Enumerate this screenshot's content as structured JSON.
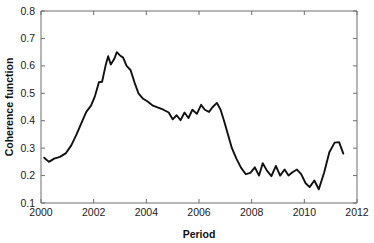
{
  "chart_data": {
    "type": "line",
    "title": "",
    "xlabel": "Period",
    "ylabel": "Coherence function",
    "xlim": [
      2000,
      2012
    ],
    "ylim": [
      0.1,
      0.8
    ],
    "xticks": [
      2000,
      2002,
      2004,
      2006,
      2008,
      2010,
      2012
    ],
    "xtick_labels": [
      "2000",
      "2002",
      "2004",
      "2006",
      "2008",
      "2010",
      "2012"
    ],
    "yticks": [
      0.1,
      0.2,
      0.3,
      0.4,
      0.5,
      0.6,
      0.7,
      0.8
    ],
    "ytick_labels": [
      "0.1",
      "0.2",
      "0.3",
      "0.4",
      "0.5",
      "0.6",
      "0.7",
      "0.8"
    ],
    "grid": false,
    "legend": null,
    "line_color": "#111111",
    "axis_color": "#6f6f6f",
    "background_color": "#ffffff",
    "series": [
      {
        "name": "Coherence function",
        "x": [
          2000.12,
          2000.3,
          2000.5,
          2000.72,
          2000.95,
          2001.15,
          2001.35,
          2001.55,
          2001.72,
          2001.9,
          2002.05,
          2002.2,
          2002.32,
          2002.45,
          2002.55,
          2002.65,
          2002.78,
          2002.88,
          2003.0,
          2003.12,
          2003.25,
          2003.4,
          2003.55,
          2003.7,
          2003.88,
          2004.05,
          2004.25,
          2004.45,
          2004.65,
          2004.85,
          2005.0,
          2005.15,
          2005.3,
          2005.45,
          2005.6,
          2005.75,
          2005.92,
          2006.08,
          2006.22,
          2006.38,
          2006.52,
          2006.68,
          2006.82,
          2006.95,
          2007.1,
          2007.25,
          2007.42,
          2007.6,
          2007.78,
          2007.95,
          2008.12,
          2008.28,
          2008.42,
          2008.58,
          2008.75,
          2008.92,
          2009.08,
          2009.25,
          2009.4,
          2009.55,
          2009.72,
          2009.88,
          2010.05,
          2010.2,
          2010.38,
          2010.55,
          2010.75,
          2010.95,
          2011.15,
          2011.32,
          2011.48
        ],
        "y": [
          0.265,
          0.25,
          0.262,
          0.268,
          0.282,
          0.31,
          0.35,
          0.395,
          0.432,
          0.455,
          0.49,
          0.54,
          0.542,
          0.6,
          0.635,
          0.605,
          0.625,
          0.65,
          0.638,
          0.63,
          0.6,
          0.585,
          0.54,
          0.5,
          0.48,
          0.47,
          0.455,
          0.448,
          0.44,
          0.43,
          0.405,
          0.42,
          0.402,
          0.43,
          0.41,
          0.44,
          0.425,
          0.458,
          0.44,
          0.432,
          0.45,
          0.465,
          0.44,
          0.4,
          0.35,
          0.3,
          0.262,
          0.228,
          0.205,
          0.21,
          0.23,
          0.2,
          0.245,
          0.218,
          0.198,
          0.235,
          0.2,
          0.222,
          0.2,
          0.212,
          0.222,
          0.205,
          0.172,
          0.158,
          0.182,
          0.15,
          0.21,
          0.285,
          0.32,
          0.322,
          0.28
        ]
      }
    ]
  },
  "axes": {
    "x_title": "Period",
    "y_title": "Coherence function"
  }
}
